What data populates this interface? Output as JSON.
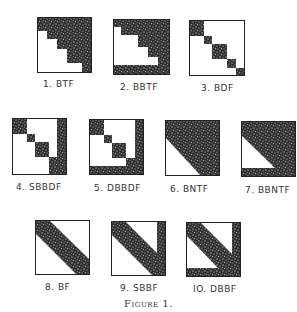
{
  "figure": {
    "caption": "Figure 1.",
    "fill_color": "#3a3a3a",
    "panels": [
      {
        "id": 1,
        "label": "1. BTF",
        "name": "block-triangular-form"
      },
      {
        "id": 2,
        "label": "2. BBTF",
        "name": "bordered-block-triangular-form"
      },
      {
        "id": 3,
        "label": "3. BDF",
        "name": "block-diagonal-form"
      },
      {
        "id": 4,
        "label": "4. SBBDF",
        "name": "singly-bordered-block-diagonal-form"
      },
      {
        "id": 5,
        "label": "5. DBBDF",
        "name": "doubly-bordered-block-diagonal-form"
      },
      {
        "id": 6,
        "label": "6. BNTF",
        "name": "banded-triangular-form"
      },
      {
        "id": 7,
        "label": "7. BBNTF",
        "name": "bordered-banded-triangular-form"
      },
      {
        "id": 8,
        "label": "8. BF",
        "name": "banded-form"
      },
      {
        "id": 9,
        "label": "9. SBBF",
        "name": "singly-bordered-banded-form"
      },
      {
        "id": 10,
        "label": "IO. DBBF",
        "name": "doubly-bordered-banded-form"
      }
    ]
  }
}
